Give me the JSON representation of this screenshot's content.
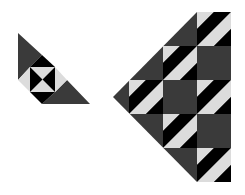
{
  "diagram": {
    "title": "",
    "colors": {
      "background": "#ffffff",
      "dark_gray": "#3a3a3a",
      "black": "#000000",
      "light_gray": "#dcdcdc"
    },
    "small_piece": {
      "label": "",
      "parts": [
        "dark-triangle-top",
        "hourglass-center",
        "dark-triangle-bottom"
      ]
    },
    "large_piece": {
      "label": "",
      "block_size_px": 34,
      "columns": 3,
      "rows": 5,
      "hourglass_blocks": [
        {
          "col": 2,
          "row": 0
        },
        {
          "col": 1,
          "row": 1
        },
        {
          "col": 0,
          "row": 2
        },
        {
          "col": 2,
          "row": 2
        },
        {
          "col": 1,
          "row": 3
        },
        {
          "col": 2,
          "row": 4
        }
      ],
      "plain_dark_blocks": [
        {
          "col": 2,
          "row": 1
        },
        {
          "col": 1,
          "row": 2
        },
        {
          "col": 2,
          "row": 3
        }
      ]
    }
  }
}
